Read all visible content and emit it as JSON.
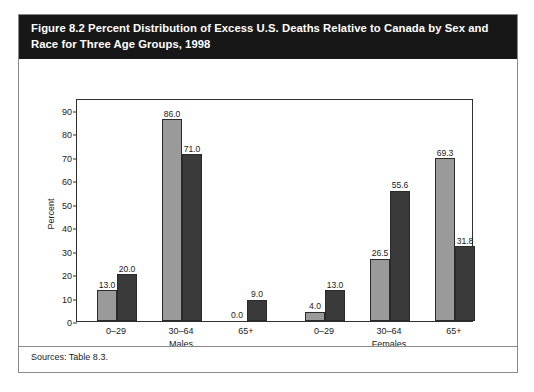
{
  "figure": {
    "title": "Figure 8.2 Percent Distribution of Excess U.S. Deaths Relative to Canada by Sex and Race for Three Age Groups, 1998",
    "source_note": "Sources: Table 8.3.",
    "title_bar_color": "#171717",
    "card_border_color": "#8a8a8a"
  },
  "legend": {
    "entries": [
      {
        "label": "Whites",
        "color": "#9a9a9a",
        "swatch": "legend-swatch-whites"
      },
      {
        "label": "Non-whites",
        "color": "#3a3a3a",
        "swatch": "legend-swatch-nonwhites"
      }
    ]
  },
  "chart_data": {
    "type": "bar",
    "title": "Figure 8.2 Percent Distribution of Excess U.S. Deaths Relative to Canada by Sex and Race for Three Age Groups, 1998",
    "xlabel": "",
    "ylabel": "Percent",
    "ylim": [
      0,
      95
    ],
    "yticks": [
      0,
      10,
      20,
      30,
      40,
      50,
      60,
      70,
      80,
      90
    ],
    "ytick_labels": [
      "0",
      "10",
      "20",
      "30",
      "40",
      "50",
      "60",
      "70",
      "80",
      "90"
    ],
    "grid": false,
    "legend_position": "top-center",
    "group_labels": [
      "Males",
      "Females"
    ],
    "categories": [
      "0–29",
      "30–64",
      "65+",
      "0–29",
      "30–64",
      "65+"
    ],
    "category_groups": [
      "Males",
      "Males",
      "Males",
      "Females",
      "Females",
      "Females"
    ],
    "series": [
      {
        "name": "Whites",
        "color": "#9a9a9a",
        "values": [
          13.0,
          86.0,
          0.0,
          4.0,
          26.5,
          69.3
        ],
        "labels": [
          "13.0",
          "86.0",
          "0.0",
          "4.0",
          "26.5",
          "69.3"
        ]
      },
      {
        "name": "Non-whites",
        "color": "#3a3a3a",
        "values": [
          20.0,
          71.0,
          9.0,
          13.0,
          55.6,
          31.8
        ],
        "labels": [
          "20.0",
          "71.0",
          "9.0",
          "13.0",
          "55.6",
          "31.8"
        ]
      }
    ]
  }
}
